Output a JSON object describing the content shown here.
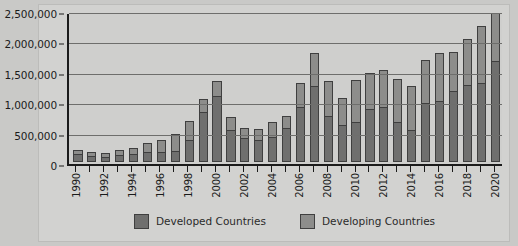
{
  "chart_data": {
    "type": "bar",
    "stacked": true,
    "title": "",
    "xlabel": "",
    "ylabel": "",
    "ylim": [
      0,
      2500000
    ],
    "yticks": [
      0,
      500000,
      1000000,
      1500000,
      2000000,
      2500000
    ],
    "ytick_labels": [
      "0",
      "500,000",
      "1,000,000",
      "1,500,000",
      "2,000,000",
      "2,500,000"
    ],
    "grid": true,
    "legend_position": "bottom",
    "categories": [
      "1990",
      "1991",
      "1992",
      "1993",
      "1994",
      "1995",
      "1996",
      "1997",
      "1998",
      "1999",
      "2000",
      "2001",
      "2002",
      "2003",
      "2004",
      "2005",
      "2006",
      "2007",
      "2008",
      "2009",
      "2010",
      "2011",
      "2012",
      "2013",
      "2014",
      "2015",
      "2016",
      "2017",
      "2018",
      "2019",
      "2020"
    ],
    "xtick_labels_shown": [
      "1990",
      "",
      "1992",
      "",
      "1994",
      "",
      "1996",
      "",
      "1998",
      "",
      "2000",
      "",
      "2002",
      "",
      "2004",
      "",
      "2006",
      "",
      "2008",
      "",
      "2010",
      "",
      "2012",
      "",
      "2014",
      "",
      "2016",
      "",
      "2018",
      "",
      "2020"
    ],
    "series": [
      {
        "name": "Developed Countries",
        "color": "#6f6f6e",
        "values": [
          130000,
          95000,
          90000,
          110000,
          130000,
          160000,
          170000,
          190000,
          360000,
          830000,
          1100000,
          540000,
          400000,
          370000,
          420000,
          560000,
          920000,
          1270000,
          760000,
          620000,
          670000,
          890000,
          910000,
          670000,
          530000,
          980000,
          1020000,
          1190000,
          1280000,
          1310000,
          1680000
        ]
      },
      {
        "name": "Developing Countries",
        "color": "#8d8d8b",
        "values": [
          75000,
          65000,
          60000,
          90000,
          110000,
          155000,
          205000,
          280000,
          320000,
          220000,
          250000,
          210000,
          160000,
          180000,
          250000,
          200000,
          390000,
          540000,
          590000,
          450000,
          700000,
          600000,
          620000,
          710000,
          730000,
          720000,
          790000,
          650000,
          770000,
          960000,
          800000
        ]
      }
    ]
  },
  "legend": {
    "items": [
      {
        "label": "Developed Countries",
        "color": "#6f6f6e"
      },
      {
        "label": "Developing Countries",
        "color": "#8d8d8b"
      }
    ]
  }
}
